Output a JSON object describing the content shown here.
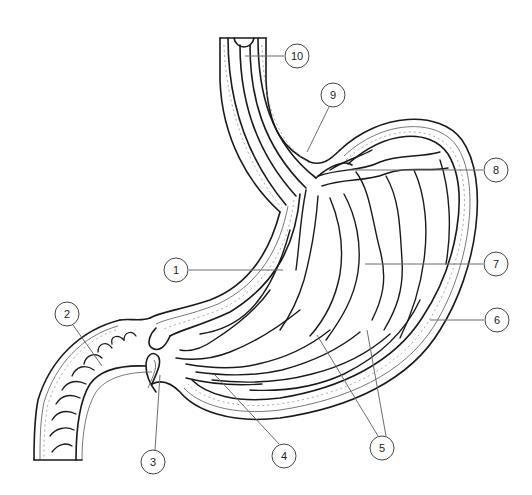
{
  "diagram": {
    "callouts": [
      {
        "number": "1",
        "cx": 176,
        "cy": 270,
        "line": [
          189,
          270,
          283,
          270
        ]
      },
      {
        "number": "2",
        "cx": 67,
        "cy": 314,
        "line": [
          73,
          325,
          102,
          366
        ]
      },
      {
        "number": "3",
        "cx": 153,
        "cy": 462,
        "line": [
          155,
          450,
          160,
          375
        ]
      },
      {
        "number": "4",
        "cx": 284,
        "cy": 456,
        "line": [
          279,
          444,
          215,
          375
        ]
      },
      {
        "number": "5",
        "cx": 382,
        "cy": 448,
        "line": [
          378,
          436,
          317,
          335
        ]
      },
      {
        "number": "5b",
        "cx": 382,
        "cy": 448,
        "line": [
          386,
          436,
          367,
          330
        ]
      },
      {
        "number": "6",
        "cx": 497,
        "cy": 320,
        "line": [
          484,
          320,
          430,
          320
        ]
      },
      {
        "number": "7",
        "cx": 496,
        "cy": 264,
        "line": [
          483,
          264,
          365,
          264
        ]
      },
      {
        "number": "8",
        "cx": 496,
        "cy": 170,
        "line": [
          483,
          170,
          350,
          170
        ]
      },
      {
        "number": "9",
        "cx": 333,
        "cy": 95,
        "line": [
          329,
          107,
          307,
          152
        ]
      },
      {
        "number": "10",
        "cx": 297,
        "cy": 56,
        "line": [
          284,
          56,
          245,
          56
        ]
      }
    ],
    "labels": {
      "c1": "1",
      "c2": "2",
      "c3": "3",
      "c4": "4",
      "c5": "5",
      "c6": "6",
      "c7": "7",
      "c8": "8",
      "c9": "9",
      "c10": "10"
    },
    "colors": {
      "outline": "#1a1a1a",
      "leader": "#6d6d6d",
      "background": "#ffffff"
    }
  }
}
